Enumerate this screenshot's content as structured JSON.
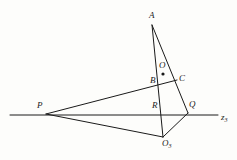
{
  "figure": {
    "kind": "geometry-diagram",
    "background_color": "#fdfdfb",
    "stroke_color": "#1a1a1a",
    "label_color": "#1a1a1a",
    "points": [
      {
        "id": "A",
        "label": "A",
        "sub": "",
        "x": 152,
        "y": 25,
        "label_x": 149,
        "label_y": 11,
        "marked": false
      },
      {
        "id": "O",
        "label": "O",
        "sub": "",
        "x": 163,
        "y": 74,
        "label_x": 159,
        "label_y": 61,
        "marked": true
      },
      {
        "id": "B",
        "label": "B",
        "sub": "",
        "x": 157,
        "y": 81,
        "label_x": 150,
        "label_y": 76,
        "marked": false
      },
      {
        "id": "C",
        "label": "C",
        "sub": "",
        "x": 177,
        "y": 80,
        "label_x": 179,
        "label_y": 74,
        "marked": false
      },
      {
        "id": "R",
        "label": "R",
        "sub": "",
        "x": 162,
        "y": 113,
        "label_x": 152,
        "label_y": 101,
        "marked": false
      },
      {
        "id": "Q",
        "label": "Q",
        "sub": "",
        "x": 188,
        "y": 113,
        "label_x": 189,
        "label_y": 100,
        "marked": false
      },
      {
        "id": "P",
        "label": "P",
        "sub": "",
        "x": 46,
        "y": 114,
        "label_x": 37,
        "label_y": 101,
        "marked": false
      },
      {
        "id": "O3",
        "label": "O",
        "sub": "3",
        "x": 163,
        "y": 137,
        "label_x": 162,
        "label_y": 139,
        "marked": false
      },
      {
        "id": "z3",
        "label": "z",
        "sub": "3",
        "x": 218,
        "y": 115,
        "label_x": 221,
        "label_y": 113,
        "marked": false
      }
    ],
    "segments": [
      {
        "name": "axis-z3",
        "from": [
          10,
          115
        ],
        "to": [
          218,
          115
        ]
      },
      {
        "name": "A-to-R-O3",
        "from": [
          152,
          25
        ],
        "to": [
          163,
          137
        ]
      },
      {
        "name": "A-to-C-Q",
        "from": [
          152,
          25
        ],
        "to": [
          188,
          113
        ]
      },
      {
        "name": "P-to-C",
        "from": [
          46,
          114
        ],
        "to": [
          177,
          80
        ]
      },
      {
        "name": "P-to-O3",
        "from": [
          46,
          114
        ],
        "to": [
          163,
          137
        ]
      },
      {
        "name": "O3-to-Q",
        "from": [
          163,
          137
        ],
        "to": [
          188,
          113
        ]
      }
    ],
    "dot_radius": 1.6,
    "stroke_width": 1.0
  }
}
